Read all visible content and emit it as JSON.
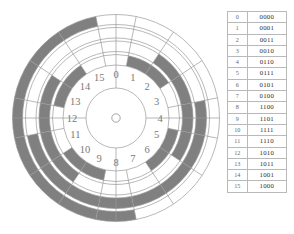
{
  "figure": {
    "colors": {
      "dark_segment": "#808080",
      "light_segment": "#ffffff",
      "outline": "#9a9a9a",
      "label_text": "#7a7a7a",
      "table_border": "#b9b9b9",
      "table_decimal_text": "#6a6a6a",
      "table_binary_text": "#2e2e2e"
    }
  },
  "disc": {
    "sector_count": 16,
    "ring_count": 4,
    "ring_order": "outermost-ring-is-bit-1-leftmost",
    "hub_label": "",
    "sector_labels": [
      "0",
      "1",
      "2",
      "3",
      "4",
      "5",
      "6",
      "7",
      "8",
      "9",
      "10",
      "11",
      "12",
      "13",
      "14",
      "15"
    ],
    "sector_codes": [
      "0000",
      "0001",
      "0011",
      "0010",
      "0110",
      "0111",
      "0101",
      "0100",
      "1100",
      "1101",
      "1111",
      "1110",
      "1010",
      "1011",
      "1001",
      "1000"
    ]
  },
  "table": {
    "rows": [
      {
        "decimal": "0",
        "gray": "0000"
      },
      {
        "decimal": "1",
        "gray": "0001"
      },
      {
        "decimal": "2",
        "gray": "0011"
      },
      {
        "decimal": "3",
        "gray": "0010"
      },
      {
        "decimal": "4",
        "gray": "0110"
      },
      {
        "decimal": "5",
        "gray": "0111"
      },
      {
        "decimal": "6",
        "gray": "0101"
      },
      {
        "decimal": "7",
        "gray": "0100"
      },
      {
        "decimal": "8",
        "gray": "1100"
      },
      {
        "decimal": "9",
        "gray": "1101"
      },
      {
        "decimal": "10",
        "gray": "1111"
      },
      {
        "decimal": "11",
        "gray": "1110"
      },
      {
        "decimal": "12",
        "gray": "1010"
      },
      {
        "decimal": "13",
        "gray": "1011"
      },
      {
        "decimal": "14",
        "gray": "1001"
      },
      {
        "decimal": "15",
        "gray": "1000"
      }
    ]
  }
}
